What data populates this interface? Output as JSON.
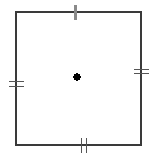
{
  "figure": {
    "type": "geometry-diagram",
    "canvas": {
      "width": 156,
      "height": 161,
      "background": "#ffffff"
    },
    "shape": {
      "name": "square",
      "kind": "quadrilateral",
      "stroke_color": "#3a3a3a",
      "stroke_width": 1.2,
      "fill": "none",
      "left": 16,
      "top": 12,
      "right": 141,
      "bottom": 145,
      "width": 125,
      "height": 133,
      "vertices": [
        {
          "label": "top-left",
          "x": 16,
          "y": 12
        },
        {
          "label": "top-right",
          "x": 141,
          "y": 12
        },
        {
          "label": "bottom-right",
          "x": 141,
          "y": 145
        },
        {
          "label": "bottom-left",
          "x": 16,
          "y": 145
        }
      ]
    },
    "center_point": {
      "name": "center-dot",
      "x": 77,
      "y": 77,
      "radius": 3.6,
      "color": "#000000"
    },
    "tick_marks": [
      {
        "id": "top-tick",
        "edge": "top",
        "orientation": "vertical",
        "count": 1,
        "color": "#8a8a8a",
        "stroke_width": 2.2,
        "length": 15,
        "center_x": 75.5,
        "center_y": 12,
        "offsets": [
          0
        ]
      },
      {
        "id": "bottom-tick",
        "edge": "bottom",
        "orientation": "vertical",
        "count": 2,
        "color": "#555555",
        "stroke_width": 1.2,
        "length": 15,
        "center_x": 84,
        "center_y": 145,
        "offsets": [
          -2.2,
          2.2
        ]
      },
      {
        "id": "left-tick",
        "edge": "left",
        "orientation": "horizontal",
        "count": 2,
        "color": "#555555",
        "stroke_width": 1.2,
        "length": 15,
        "center_x": 16,
        "center_y": 84,
        "offsets": [
          -2.2,
          2.2
        ]
      },
      {
        "id": "right-tick",
        "edge": "right",
        "orientation": "horizontal",
        "count": 2,
        "color": "#555555",
        "stroke_width": 1.2,
        "length": 15,
        "center_x": 141,
        "center_y": 71.5,
        "offsets": [
          -2.2,
          2.2
        ]
      }
    ]
  }
}
